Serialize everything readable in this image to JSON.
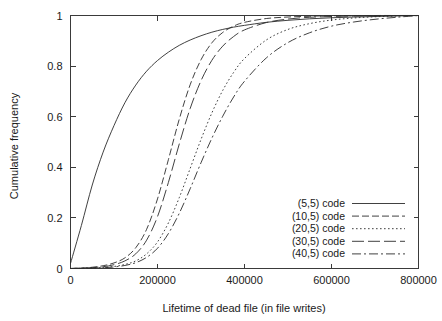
{
  "chart_data": {
    "type": "line",
    "title": "",
    "xlabel": "Lifetime of dead file (in file writes)",
    "ylabel": "Cumulative frequency",
    "xlim": [
      0,
      800000
    ],
    "ylim": [
      0,
      1
    ],
    "xticks": [
      0,
      200000,
      400000,
      600000,
      800000
    ],
    "xticklabels": [
      "0",
      "200000",
      "400000",
      "600000",
      "800000"
    ],
    "yticks": [
      0,
      0.2,
      0.4,
      0.6,
      0.8,
      1
    ],
    "yticklabels": [
      "0",
      "0.2",
      "0.4",
      "0.6",
      "0.8",
      "1"
    ],
    "grid": false,
    "legend_position": "lower right",
    "x": [
      0,
      25000,
      50000,
      75000,
      100000,
      125000,
      150000,
      175000,
      200000,
      225000,
      250000,
      275000,
      300000,
      325000,
      350000,
      375000,
      400000,
      450000,
      500000,
      550000,
      600000,
      650000,
      700000,
      750000,
      800000
    ],
    "series": [
      {
        "name": "(5,5) code",
        "dash": "solid",
        "values": [
          0.02,
          0.17,
          0.33,
          0.46,
          0.565,
          0.655,
          0.725,
          0.78,
          0.822,
          0.855,
          0.882,
          0.903,
          0.92,
          0.934,
          0.945,
          0.954,
          0.961,
          0.973,
          0.981,
          0.987,
          0.991,
          0.994,
          0.996,
          0.998,
          1.0
        ]
      },
      {
        "name": "(10,5) code",
        "dash": "dashed",
        "values": [
          0.0,
          0.002,
          0.005,
          0.011,
          0.022,
          0.042,
          0.082,
          0.155,
          0.275,
          0.43,
          0.59,
          0.726,
          0.825,
          0.892,
          0.933,
          0.958,
          0.973,
          0.988,
          0.994,
          0.997,
          0.999,
          0.999,
          1.0,
          1.0,
          1.0
        ]
      },
      {
        "name": "(20,5) code",
        "dash": "dotted",
        "values": [
          0.0,
          0.001,
          0.002,
          0.004,
          0.008,
          0.016,
          0.03,
          0.058,
          0.105,
          0.18,
          0.28,
          0.395,
          0.51,
          0.615,
          0.704,
          0.775,
          0.83,
          0.903,
          0.945,
          0.968,
          0.982,
          0.99,
          0.995,
          0.998,
          1.0
        ]
      },
      {
        "name": "(30,5) code",
        "dash": "longdash",
        "values": [
          0.0,
          0.001,
          0.003,
          0.007,
          0.015,
          0.03,
          0.058,
          0.112,
          0.205,
          0.34,
          0.492,
          0.632,
          0.742,
          0.823,
          0.879,
          0.917,
          0.943,
          0.972,
          0.986,
          0.993,
          0.996,
          0.998,
          0.999,
          1.0,
          1.0
        ]
      },
      {
        "name": "(40,5) code",
        "dash": "dashdot",
        "values": [
          0.0,
          0.001,
          0.002,
          0.003,
          0.006,
          0.012,
          0.023,
          0.044,
          0.08,
          0.138,
          0.218,
          0.315,
          0.418,
          0.515,
          0.602,
          0.678,
          0.74,
          0.832,
          0.893,
          0.932,
          0.958,
          0.974,
          0.985,
          0.993,
          1.0
        ]
      }
    ]
  },
  "legend": {
    "entries": [
      {
        "label": "(5,5) code"
      },
      {
        "label": "(10,5) code"
      },
      {
        "label": "(20,5) code"
      },
      {
        "label": "(30,5) code"
      },
      {
        "label": "(40,5) code"
      }
    ]
  }
}
